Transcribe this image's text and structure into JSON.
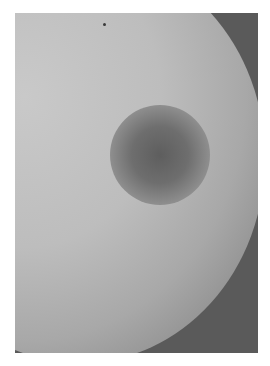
{
  "image": {
    "description": "Grayscale clinical photograph of a skin surface with a darker circular region",
    "colors": {
      "background": "#ffffff",
      "shadow": "#5a5a5a",
      "surface_light": "#c9c9c9",
      "lesion_dark": "#5e5e5e"
    }
  }
}
